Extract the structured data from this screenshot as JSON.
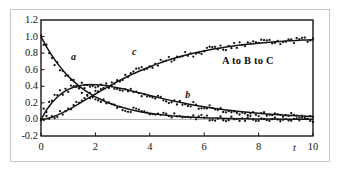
{
  "chart_data": {
    "type": "line",
    "title": "",
    "annotation": "A to B to C",
    "xlabel": "t",
    "ylabel": "",
    "xlim": [
      0,
      10
    ],
    "ylim": [
      -0.2,
      1.2
    ],
    "grid": "zero-line only",
    "legend": "inline curve labels",
    "xticks": [
      "0",
      "2",
      "4",
      "6",
      "8",
      "10"
    ],
    "xtick_values": [
      0,
      2,
      4,
      6,
      8,
      10
    ],
    "yticks": [
      "1.2",
      "1.0",
      "0.8",
      "0.6",
      "0.4",
      "0.2",
      "0.0",
      "-0.2"
    ],
    "ytick_values": [
      1.2,
      1.0,
      0.8,
      0.6,
      0.4,
      0.2,
      0.0,
      -0.2
    ],
    "x": [
      0,
      0.2,
      0.4,
      0.6,
      0.8,
      1,
      1.2,
      1.4,
      1.6,
      1.8,
      2,
      2.2,
      2.4,
      2.6,
      2.8,
      3,
      3.2,
      3.4,
      3.6,
      3.8,
      4,
      4.2,
      4.4,
      4.6,
      4.8,
      5,
      5.2,
      5.4,
      5.6,
      5.8,
      6,
      6.2,
      6.4,
      6.6,
      6.8,
      7,
      7.2,
      7.4,
      7.6,
      7.8,
      8,
      8.2,
      8.4,
      8.6,
      8.8,
      9,
      9.2,
      9.4,
      9.6,
      9.8,
      10
    ],
    "series": [
      {
        "name": "a",
        "label": "a",
        "label_x": 1.1,
        "label_y": 0.76,
        "values": [
          1.0,
          0.878,
          0.771,
          0.677,
          0.595,
          0.522,
          0.459,
          0.403,
          0.354,
          0.311,
          0.273,
          0.24,
          0.211,
          0.185,
          0.162,
          0.143,
          0.125,
          0.11,
          0.097,
          0.085,
          0.075,
          0.066,
          0.058,
          0.051,
          0.044,
          0.039,
          0.034,
          0.03,
          0.027,
          0.023,
          0.021,
          0.018,
          0.016,
          0.014,
          0.012,
          0.011,
          0.009,
          0.008,
          0.007,
          0.006,
          0.006,
          0.005,
          0.004,
          0.004,
          0.003,
          0.003,
          0.003,
          0.002,
          0.002,
          0.002,
          0.002
        ]
      },
      {
        "name": "b",
        "label": "b",
        "label_x": 5.3,
        "label_y": 0.3,
        "values": [
          0.0,
          0.113,
          0.202,
          0.271,
          0.323,
          0.362,
          0.389,
          0.407,
          0.417,
          0.421,
          0.42,
          0.415,
          0.407,
          0.396,
          0.383,
          0.369,
          0.354,
          0.338,
          0.322,
          0.306,
          0.289,
          0.273,
          0.257,
          0.242,
          0.227,
          0.213,
          0.2,
          0.187,
          0.175,
          0.163,
          0.152,
          0.142,
          0.132,
          0.123,
          0.115,
          0.107,
          0.099,
          0.092,
          0.086,
          0.08,
          0.074,
          0.069,
          0.064,
          0.059,
          0.055,
          0.051,
          0.047,
          0.044,
          0.04,
          0.038,
          0.035
        ]
      },
      {
        "name": "c",
        "label": "c",
        "label_x": 3.35,
        "label_y": 0.82,
        "values": [
          0.0,
          0.009,
          0.027,
          0.052,
          0.082,
          0.116,
          0.152,
          0.19,
          0.229,
          0.268,
          0.307,
          0.345,
          0.382,
          0.419,
          0.455,
          0.488,
          0.521,
          0.552,
          0.581,
          0.609,
          0.636,
          0.661,
          0.685,
          0.707,
          0.729,
          0.748,
          0.766,
          0.783,
          0.798,
          0.814,
          0.827,
          0.84,
          0.852,
          0.863,
          0.873,
          0.882,
          0.892,
          0.9,
          0.907,
          0.914,
          0.92,
          0.926,
          0.932,
          0.937,
          0.942,
          0.946,
          0.95,
          0.954,
          0.958,
          0.96,
          0.963
        ]
      }
    ],
    "scatter_noise_amplitude": 0.035,
    "colors": {
      "curve": "#141414",
      "points": "#141414",
      "axis": "#141414",
      "zero_line": "#b4b4b4",
      "outer_frame": "#c8c8c8",
      "background": "#ffffff"
    }
  }
}
